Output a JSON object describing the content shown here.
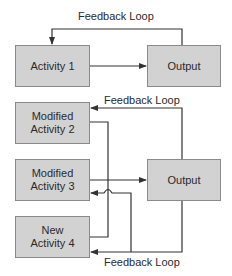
{
  "colors": {
    "box_fill": "#d2d2d2",
    "box_border": "#8a8a8a",
    "line": "#333333",
    "text": "#2a2a2a",
    "background": "#ffffff"
  },
  "top_section": {
    "activity": {
      "label": "Activity 1"
    },
    "output": {
      "label": "Output"
    },
    "feedback_label": "Feedback Loop"
  },
  "bottom_section": {
    "activities": [
      {
        "label_line1": "Modified",
        "label_line2": "Activity 2"
      },
      {
        "label_line1": "Modified",
        "label_line2": "Activity 3"
      },
      {
        "label_line1": "New",
        "label_line2": "Activity 4"
      }
    ],
    "output": {
      "label": "Output"
    },
    "feedback_label_top": "Feedback Loop",
    "feedback_label_bottom": "Feedback Loop"
  }
}
